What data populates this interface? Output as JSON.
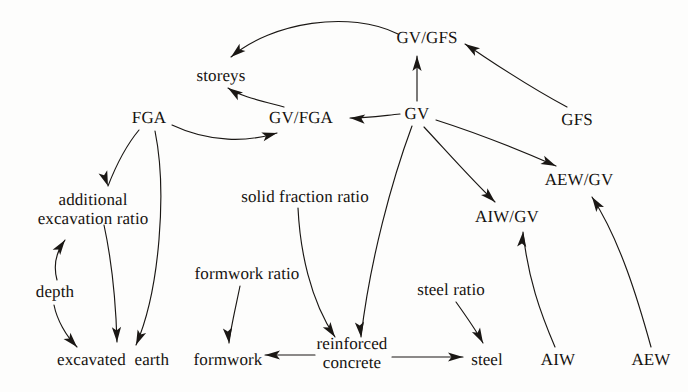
{
  "diagram": {
    "type": "directed-graph",
    "background_color": "#fdfdfc",
    "ink_color": "#1a1714",
    "width": 688,
    "height": 392,
    "nodes": [
      {
        "id": "storeys",
        "label": "storeys",
        "x": 221,
        "y": 76,
        "lines": [
          "storeys"
        ]
      },
      {
        "id": "gv_gfs",
        "label": "GV/GFS",
        "x": 427,
        "y": 38,
        "lines": [
          "GV/GFS"
        ]
      },
      {
        "id": "fga",
        "label": "FGA",
        "x": 149,
        "y": 118,
        "lines": [
          "FGA"
        ]
      },
      {
        "id": "gv_fga",
        "label": "GV/FGA",
        "x": 301,
        "y": 118,
        "lines": [
          "GV/FGA"
        ]
      },
      {
        "id": "gv",
        "label": "GV",
        "x": 417,
        "y": 114,
        "lines": [
          "GV"
        ]
      },
      {
        "id": "gfs",
        "label": "GFS",
        "x": 577,
        "y": 120,
        "lines": [
          "GFS"
        ]
      },
      {
        "id": "aew_gv",
        "label": "AEW/GV",
        "x": 579,
        "y": 180,
        "lines": [
          "AEW/GV"
        ]
      },
      {
        "id": "aiw_gv",
        "label": "AIW/GV",
        "x": 507,
        "y": 217,
        "lines": [
          "AIW/GV"
        ]
      },
      {
        "id": "additional_exc",
        "label": "additional excavation ratio",
        "x": 93,
        "y": 209,
        "lines": [
          "additional",
          "excavation ratio"
        ]
      },
      {
        "id": "solid_fraction",
        "label": "solid fraction ratio",
        "x": 305,
        "y": 197,
        "lines": [
          "solid fraction ratio"
        ]
      },
      {
        "id": "formwork_ratio",
        "label": "formwork ratio",
        "x": 247,
        "y": 274,
        "lines": [
          "formwork ratio"
        ]
      },
      {
        "id": "steel_ratio",
        "label": "steel ratio",
        "x": 451,
        "y": 290,
        "lines": [
          "steel ratio"
        ]
      },
      {
        "id": "depth",
        "label": "depth",
        "x": 55,
        "y": 292,
        "lines": [
          "depth"
        ]
      },
      {
        "id": "excavated_earth",
        "label": "excavated  earth",
        "x": 113,
        "y": 360,
        "lines": [
          "excavated  earth"
        ]
      },
      {
        "id": "formwork",
        "label": "formwork",
        "x": 228,
        "y": 360,
        "lines": [
          "formwork"
        ]
      },
      {
        "id": "reinforced_conc",
        "label": "reinforced concrete",
        "x": 352,
        "y": 353,
        "lines": [
          "reinforced",
          "concrete"
        ]
      },
      {
        "id": "steel",
        "label": "steel",
        "x": 487,
        "y": 360,
        "lines": [
          "steel"
        ]
      },
      {
        "id": "aiw",
        "label": "AIW",
        "x": 558,
        "y": 360,
        "lines": [
          "AIW"
        ]
      },
      {
        "id": "aew",
        "label": "AEW",
        "x": 651,
        "y": 360,
        "lines": [
          "AEW"
        ]
      }
    ],
    "edges": [
      {
        "id": "e1",
        "from": "gv_gfs",
        "to": "storeys",
        "label": "GV/GFS to storeys"
      },
      {
        "id": "e2",
        "from": "gv",
        "to": "gv_gfs",
        "label": "GV to GV/GFS"
      },
      {
        "id": "e3",
        "from": "gfs",
        "to": "gv_gfs",
        "label": "GFS to GV/GFS"
      },
      {
        "id": "e4",
        "from": "gv_fga",
        "to": "storeys",
        "label": "GV/FGA to storeys"
      },
      {
        "id": "e5",
        "from": "gv",
        "to": "gv_fga",
        "label": "GV to GV/FGA"
      },
      {
        "id": "e6",
        "from": "fga",
        "to": "gv_fga",
        "label": "FGA to GV/FGA"
      },
      {
        "id": "e7",
        "from": "fga",
        "to": "additional_exc",
        "label": "FGA to additional excavation ratio"
      },
      {
        "id": "e8",
        "from": "fga",
        "to": "excavated_earth",
        "label": "FGA to excavated earth"
      },
      {
        "id": "e9",
        "from": "additional_exc",
        "to": "excavated_earth",
        "label": "additional excavation ratio to excavated earth"
      },
      {
        "id": "e10",
        "from": "depth",
        "to": "additional_exc",
        "label": "depth to additional excavation ratio"
      },
      {
        "id": "e11",
        "from": "depth",
        "to": "excavated_earth",
        "label": "depth to excavated earth"
      },
      {
        "id": "e12",
        "from": "formwork_ratio",
        "to": "formwork",
        "label": "formwork ratio to formwork"
      },
      {
        "id": "e13",
        "from": "solid_fraction",
        "to": "reinforced_conc",
        "label": "solid fraction ratio to reinforced concrete"
      },
      {
        "id": "e14",
        "from": "gv",
        "to": "reinforced_conc",
        "label": "GV to reinforced concrete"
      },
      {
        "id": "e15",
        "from": "reinforced_conc",
        "to": "formwork",
        "label": "reinforced concrete to formwork"
      },
      {
        "id": "e16",
        "from": "reinforced_conc",
        "to": "steel",
        "label": "reinforced concrete to steel"
      },
      {
        "id": "e17",
        "from": "steel_ratio",
        "to": "steel",
        "label": "steel ratio to steel"
      },
      {
        "id": "e18",
        "from": "gv",
        "to": "aiw_gv",
        "label": "GV to AIW/GV"
      },
      {
        "id": "e19",
        "from": "aiw",
        "to": "aiw_gv",
        "label": "AIW to AIW/GV"
      },
      {
        "id": "e20",
        "from": "gv",
        "to": "aew_gv",
        "label": "GV to AEW/GV"
      },
      {
        "id": "e21",
        "from": "aew",
        "to": "aew_gv",
        "label": "AEW to AEW/GV"
      }
    ],
    "edge_paths": {
      "e1": "M 398 34 C 350 10 272 22 231 57",
      "e2": "M 417 101 L 417 56",
      "e3": "M 567 107 C 520 82 490 60 465 44",
      "e4": "M 284 107 C 258 100 240 96 228 88",
      "e5": "M 400 114 C 380 116 366 118 350 118",
      "e6": "M 172 125 C 210 143 248 142 277 133",
      "e7": "M 139 130 C 124 148 115 168 108 186",
      "e8": "M 155 131 C 167 190 160 290 136 345",
      "e9": "M 104 225 C 112 262 116 308 117 342",
      "e10": "M 57 280 C 53 265 56 252 65 240",
      "e11": "M 54 305 C 57 320 66 336 77 347",
      "e12": "M 240 286 C 236 306 231 326 229 343",
      "e13": "M 298 208 C 300 250 310 300 335 337",
      "e14": "M 412 126 C 392 180 370 260 361 337",
      "e15": "M 315 355 L 265 355",
      "e16": "M 392 357 L 463 357",
      "e17": "M 456 302 C 466 316 476 330 483 343",
      "e18": "M 424 127 C 450 155 472 180 495 202",
      "e19": "M 555 347 C 540 312 528 278 523 232",
      "e20": "M 436 120 C 480 134 524 152 556 166",
      "e21": "M 651 347 C 638 300 620 240 592 197"
    },
    "arrow_heads": {
      "e1": {
        "x": 231,
        "y": 57,
        "angle": 140
      },
      "e2": {
        "x": 417,
        "y": 56,
        "angle": 270
      },
      "e3": {
        "x": 465,
        "y": 44,
        "angle": 213
      },
      "e4": {
        "x": 228,
        "y": 88,
        "angle": 214
      },
      "e5": {
        "x": 350,
        "y": 118,
        "angle": 184
      },
      "e6": {
        "x": 277,
        "y": 133,
        "angle": 345
      },
      "e7": {
        "x": 108,
        "y": 186,
        "angle": 70
      },
      "e8": {
        "x": 136,
        "y": 345,
        "angle": 113
      },
      "e9": {
        "x": 117,
        "y": 342,
        "angle": 88
      },
      "e10": {
        "x": 65,
        "y": 240,
        "angle": 305
      },
      "e11": {
        "x": 77,
        "y": 347,
        "angle": 48
      },
      "e12": {
        "x": 229,
        "y": 343,
        "angle": 84
      },
      "e13": {
        "x": 335,
        "y": 337,
        "angle": 56
      },
      "e14": {
        "x": 361,
        "y": 337,
        "angle": 84
      },
      "e15": {
        "x": 265,
        "y": 355,
        "angle": 180
      },
      "e16": {
        "x": 463,
        "y": 357,
        "angle": 0
      },
      "e17": {
        "x": 483,
        "y": 343,
        "angle": 62
      },
      "e18": {
        "x": 495,
        "y": 202,
        "angle": 44
      },
      "e19": {
        "x": 523,
        "y": 232,
        "angle": 275
      },
      "e20": {
        "x": 556,
        "y": 166,
        "angle": 24
      },
      "e21": {
        "x": 592,
        "y": 197,
        "angle": 237
      }
    }
  }
}
